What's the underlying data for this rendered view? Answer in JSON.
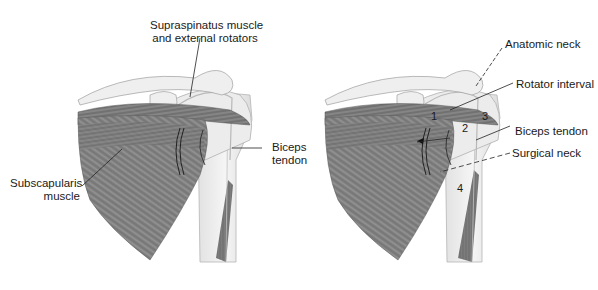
{
  "figure": {
    "left_panel": {
      "labels": {
        "supraspinatus_line1": "Supraspinatus muscle",
        "supraspinatus_line2": "and external rotators",
        "biceps_line1": "Biceps",
        "biceps_line2": "tendon",
        "subscapularis_line1": "Subscapularis",
        "subscapularis_line2": "muscle"
      }
    },
    "right_panel": {
      "labels": {
        "anatomic_neck": "Anatomic neck",
        "rotator_interval": "Rotator interval",
        "biceps_tendon": "Biceps tendon",
        "surgical_neck": "Surgical neck"
      },
      "region_numbers": [
        "1",
        "2",
        "3",
        "4"
      ]
    },
    "colors": {
      "muscle": "#7a7a7a",
      "muscle_dark": "#555555",
      "bone": "#ededed",
      "bone_outline": "#b5b5b5",
      "leader_line": "#222222",
      "text": "#1a1a1a"
    }
  }
}
